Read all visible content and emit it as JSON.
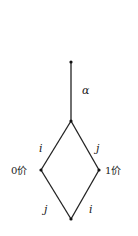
{
  "diagram": {
    "type": "lattice / Hasse diagram",
    "nodes": [
      {
        "id": "top",
        "x": 71,
        "y": 62
      },
      {
        "id": "upper",
        "x": 71,
        "y": 121
      },
      {
        "id": "left",
        "x": 41,
        "y": 170,
        "label": "0价"
      },
      {
        "id": "right",
        "x": 99,
        "y": 170,
        "label": "1价"
      },
      {
        "id": "bottom",
        "x": 71,
        "y": 219
      }
    ],
    "edges": [
      {
        "from": "top",
        "to": "upper",
        "label": "α"
      },
      {
        "from": "upper",
        "to": "left",
        "label": "i"
      },
      {
        "from": "upper",
        "to": "right",
        "label": "j"
      },
      {
        "from": "left",
        "to": "bottom",
        "label": "j"
      },
      {
        "from": "right",
        "to": "bottom",
        "label": "i"
      }
    ],
    "labels": {
      "alpha": "α",
      "upper_left": "i",
      "upper_right": "j",
      "lower_left": "j",
      "lower_right": "i",
      "left_node": "0价",
      "right_node": "1价"
    }
  }
}
